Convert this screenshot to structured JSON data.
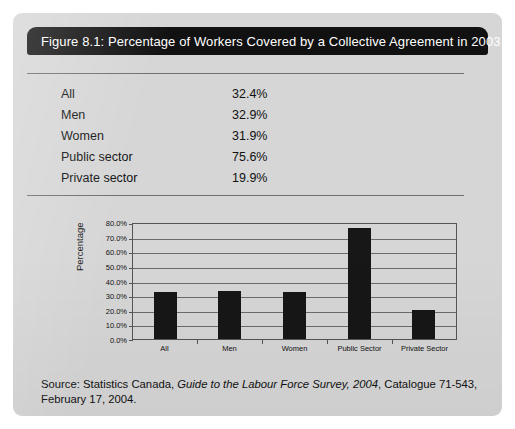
{
  "figure": {
    "title": "Figure 8.1: Percentage of Workers Covered by a Collective Agreement in 2003",
    "card_bg": "#d6d6d6",
    "title_bar_bg": "#111111",
    "title_text_color": "#ffffff"
  },
  "table": {
    "rows": [
      {
        "label": "All",
        "value": "32.4%"
      },
      {
        "label": "Men",
        "value": "32.9%"
      },
      {
        "label": "Women",
        "value": "31.9%"
      },
      {
        "label": "Public sector",
        "value": "75.6%"
      },
      {
        "label": "Private sector",
        "value": "19.9%"
      }
    ]
  },
  "source": {
    "prefix": "Source: Statistics Canada, ",
    "italic": "Guide to the Labour Force Survey, 2004",
    "suffix": ", Catalogue 71-543, February 17, 2004."
  },
  "chart_data": {
    "type": "bar",
    "title": "",
    "xlabel": "",
    "ylabel": "Percentage",
    "categories": [
      "All",
      "Men",
      "Women",
      "Public Sector",
      "Private Sector"
    ],
    "values": [
      32.4,
      32.9,
      31.9,
      75.6,
      19.9
    ],
    "ylim": [
      0,
      80
    ],
    "ytick_values": [
      80,
      70,
      60,
      50,
      40,
      30,
      20,
      10,
      0
    ],
    "ytick_labels": [
      "80.0%",
      "70.0%",
      "60.0%",
      "50.0%",
      "40.0%",
      "30.0%",
      "20.0%",
      "10.0%",
      "0.0%"
    ],
    "grid": true,
    "legend": false,
    "bar_color": "#171717",
    "plot_bg": "#d6d6d6",
    "gridline_color": "#6b6b6b"
  }
}
